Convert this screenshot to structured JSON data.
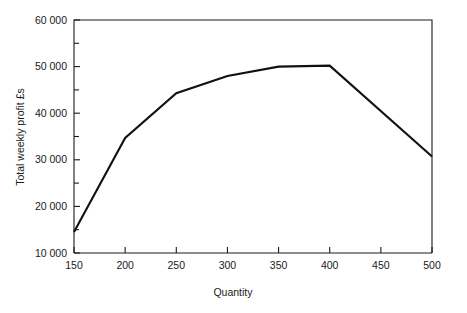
{
  "chart_data": {
    "type": "line",
    "title": "",
    "subtitle": "",
    "xlabel": "Quantity",
    "ylabel": "Total weekly profit £s",
    "xlim": [
      150,
      500
    ],
    "ylim": [
      10000,
      60000
    ],
    "grid": false,
    "legend": false,
    "legend_position": "none",
    "line_color": "#111111",
    "x_ticks": [
      150,
      200,
      250,
      300,
      350,
      400,
      450,
      500
    ],
    "x_tick_labels": [
      "150",
      "200",
      "250",
      "300",
      "350",
      "400",
      "450",
      "500"
    ],
    "y_ticks": [
      10000,
      20000,
      30000,
      40000,
      50000,
      60000
    ],
    "y_tick_labels": [
      "10 000",
      "20 000",
      "30 000",
      "40 000",
      "50 000",
      "60 000"
    ],
    "y_minor_ticks": [
      15000,
      25000,
      35000,
      45000,
      55000
    ],
    "x": [
      150,
      200,
      250,
      300,
      350,
      400,
      500
    ],
    "values": [
      14500,
      34700,
      44300,
      48000,
      50000,
      50200,
      30700
    ],
    "series": [
      {
        "name": "Total weekly profit",
        "x": [
          150,
          200,
          250,
          300,
          350,
          400,
          500
        ],
        "values": [
          14500,
          34700,
          44300,
          48000,
          50000,
          50200,
          30700
        ]
      }
    ],
    "annotations": []
  }
}
